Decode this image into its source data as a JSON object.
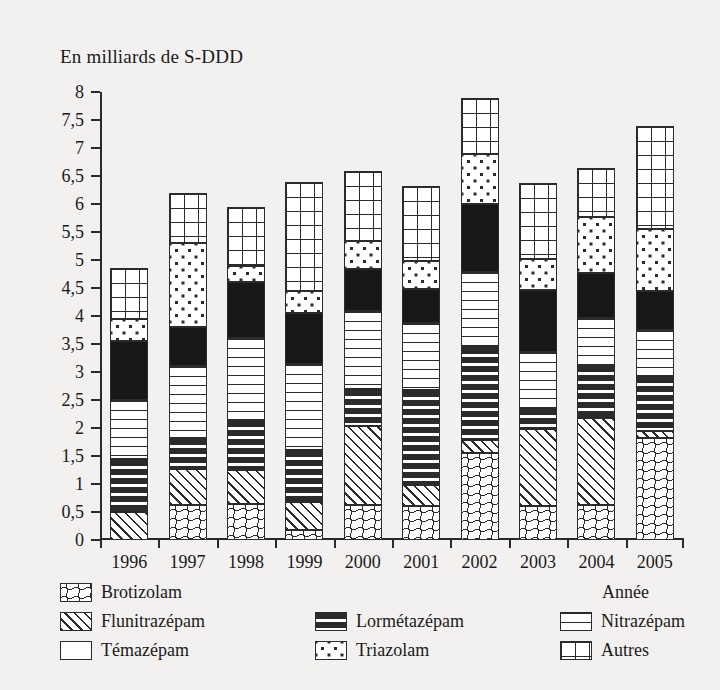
{
  "chart": {
    "axis_title": "En milliards de S-DDD",
    "xaxis_name": "Année"
  },
  "chart_data": {
    "type": "bar",
    "title": "En milliards de S-DDD",
    "subtitle": "",
    "xlabel": "Année",
    "ylabel": "En milliards de S-DDD",
    "ylim": [
      0,
      8
    ],
    "ytick_labels": [
      "8",
      "7,5",
      "7",
      "6,5",
      "6",
      "5,5",
      "5",
      "4,5",
      "4",
      "3,5",
      "3",
      "2,5",
      "2",
      "1,5",
      "1",
      "0,5",
      "0"
    ],
    "ytick_values": [
      8,
      7.5,
      7,
      6.5,
      6,
      5.5,
      5,
      4.5,
      4,
      3.5,
      3,
      2.5,
      2,
      1.5,
      1,
      0.5,
      0
    ],
    "grid": false,
    "stacked": true,
    "legend_position": "bottom",
    "categories": [
      "1996",
      "1997",
      "1998",
      "1999",
      "2000",
      "2001",
      "2002",
      "2003",
      "2004",
      "2005"
    ],
    "series": [
      {
        "name": "Brotizolam",
        "pattern": "wavy",
        "values": [
          0.0,
          0.62,
          0.65,
          0.18,
          0.62,
          0.6,
          1.55,
          0.6,
          0.62,
          1.82
        ]
      },
      {
        "name": "Flunitrazépam",
        "pattern": "diagonal-hatch",
        "values": [
          0.5,
          0.65,
          0.6,
          0.5,
          1.42,
          0.38,
          0.23,
          1.38,
          1.55,
          0.13
        ]
      },
      {
        "name": "Lormétazépam",
        "pattern": "sparse-dashes",
        "values": [
          0.95,
          0.55,
          0.9,
          0.92,
          0.65,
          1.7,
          1.67,
          0.38,
          0.95,
          0.98
        ]
      },
      {
        "name": "Nitrazépam",
        "pattern": "horizontal-lines",
        "values": [
          1.05,
          1.28,
          1.45,
          1.55,
          1.4,
          1.2,
          1.33,
          1.0,
          0.85,
          0.82
        ]
      },
      {
        "name": "Témazépam",
        "pattern": "solid-black",
        "values": [
          1.05,
          0.7,
          1.0,
          0.9,
          0.75,
          0.6,
          1.22,
          1.1,
          0.8,
          0.7
        ]
      },
      {
        "name": "Triazolam",
        "pattern": "dots",
        "values": [
          0.4,
          1.5,
          0.3,
          0.4,
          0.5,
          0.5,
          0.9,
          0.55,
          1.0,
          1.1
        ]
      },
      {
        "name": "Autres",
        "pattern": "grid",
        "values": [
          0.9,
          0.9,
          1.05,
          1.95,
          1.25,
          1.35,
          1.0,
          1.37,
          0.88,
          1.85
        ]
      }
    ],
    "totals": [
      4.85,
      6.2,
      5.95,
      6.4,
      6.59,
      6.33,
      7.9,
      6.38,
      6.65,
      7.4
    ]
  },
  "legend": {
    "items": [
      {
        "label": "Brotizolam",
        "pattern": "wavy"
      },
      {
        "label": "Flunitrazépam",
        "pattern": "diagonal-hatch"
      },
      {
        "label": "Témazépam",
        "pattern": "solid-black"
      },
      {
        "label": "Lormétazépam",
        "pattern": "sparse-dashes"
      },
      {
        "label": "Triazolam",
        "pattern": "dots"
      },
      {
        "label": "Nitrazépam",
        "pattern": "horizontal-lines"
      },
      {
        "label": "Autres",
        "pattern": "grid"
      }
    ]
  }
}
